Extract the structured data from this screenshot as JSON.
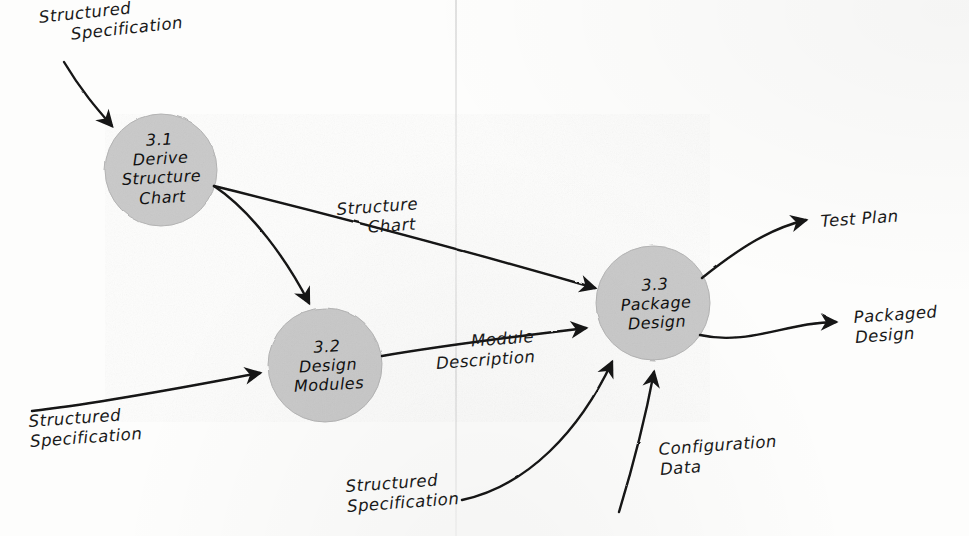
{
  "diagram": {
    "type": "data-flow-diagram",
    "style": "hand-drawn pencil sketch on paper",
    "colors": {
      "process_fill": "#c9c9c9",
      "ink": "#141414",
      "paper": "#fdfdfc"
    },
    "processes": [
      {
        "id": "3.1",
        "number": "3.1",
        "name": "Derive\nStructure\nChart",
        "label": "3.1\nDerive\nStructure\nChart",
        "cx": 161,
        "cy": 170,
        "r": 56
      },
      {
        "id": "3.2",
        "number": "3.2",
        "name": "Design\nModules",
        "label": "3.2\nDesign\nModules",
        "cx": 325,
        "cy": 365,
        "r": 57
      },
      {
        "id": "3.3",
        "number": "3.3",
        "name": "Package\nDesign",
        "label": "3.3\nPackage\nDesign",
        "cx": 653,
        "cy": 303,
        "r": 57
      }
    ],
    "flows": [
      {
        "id": "flow-struct-spec-top",
        "label": "Structured\nSpecification",
        "from": "external-top-left",
        "to": "3.1",
        "label_x": 38,
        "label_y": 8,
        "rotate": -6
      },
      {
        "id": "flow-structure-chart",
        "label": "Structure\nChart",
        "from": "3.1",
        "to": "3.3",
        "label_x": 336,
        "label_y": 200,
        "rotate": -4
      },
      {
        "id": "flow-module-description",
        "label": "Module\nDescription",
        "from": "3.2",
        "to": "3.3",
        "label_x": 434,
        "label_y": 334,
        "rotate": -4
      },
      {
        "id": "flow-struct-spec-left",
        "label": "Structured\nSpecification",
        "from": "external-bottom-left",
        "to": "3.2",
        "label_x": 28,
        "label_y": 412,
        "rotate": -4
      },
      {
        "id": "flow-struct-spec-bottom",
        "label": "Structured\nSpecification",
        "from": "external-bottom-center",
        "to": "3.3",
        "label_x": 345,
        "label_y": 477,
        "rotate": -4
      },
      {
        "id": "flow-configuration-data",
        "label": "Configuration\nData",
        "from": "external-bottom-right",
        "to": "3.3",
        "label_x": 658,
        "label_y": 440,
        "rotate": -4
      },
      {
        "id": "flow-test-plan",
        "label": "Test Plan",
        "from": "3.3",
        "to": "external-top-right",
        "label_x": 820,
        "label_y": 212,
        "rotate": -4
      },
      {
        "id": "flow-packaged-design",
        "label": "Packaged\nDesign",
        "from": "3.3",
        "to": "external-right",
        "label_x": 853,
        "label_y": 308,
        "rotate": -4
      }
    ]
  }
}
